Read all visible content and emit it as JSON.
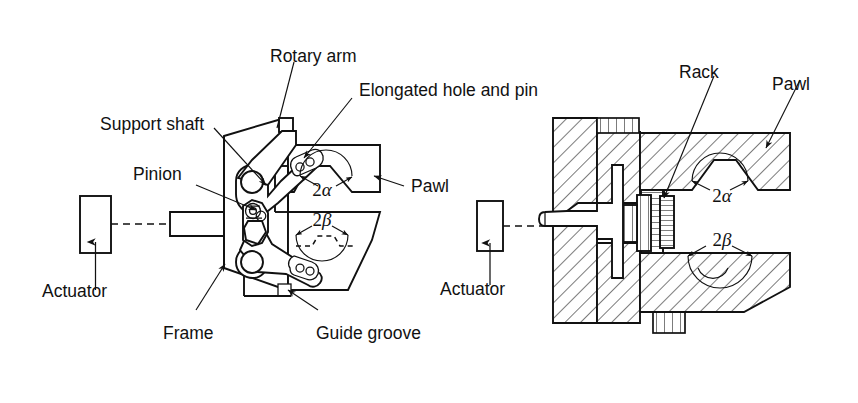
{
  "figure": {
    "type": "engineering-diagram",
    "background_color": "#ffffff",
    "line_color": "#111111"
  },
  "left_view": {
    "name": "linkage-schematic-view",
    "labels": {
      "rotary_arm": "Rotary arm",
      "elongated_hole_and_pin": "Elongated hole and pin",
      "support_shaft": "Support shaft",
      "pinion": "Pinion",
      "pawl": "Pawl",
      "actuator": "Actuator",
      "frame": "Frame",
      "guide_groove": "Guide groove"
    },
    "angles": {
      "upper": "2α",
      "lower": "2β"
    }
  },
  "right_view": {
    "name": "sectional-view",
    "labels": {
      "rack": "Rack",
      "pawl": "Pawl",
      "actuator": "Actuator"
    },
    "angles": {
      "upper": "2α",
      "lower": "2β"
    }
  }
}
